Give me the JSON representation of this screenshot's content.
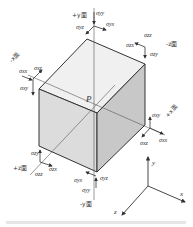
{
  "diagram": {
    "center_label": "P",
    "faces": {
      "plus_y": "+y面",
      "minus_y": "-y面",
      "plus_x": "+x面",
      "minus_x": "-x面",
      "plus_z": "+z面",
      "minus_z": "-z面"
    },
    "stresses": {
      "plus_y": [
        "σyy",
        "σyz",
        "σyx"
      ],
      "minus_y": [
        "σyx",
        "σyy",
        "σyz"
      ],
      "plus_x": [
        "σxy",
        "σxz",
        "σxx"
      ],
      "minus_x": [
        "σxx",
        "σxz",
        "σxy"
      ],
      "plus_z": [
        "σzy",
        "σzz",
        "σzx"
      ],
      "minus_z": [
        "σzz",
        "σzx",
        "σzy"
      ]
    },
    "axes": {
      "x": "x",
      "y": "y",
      "z": "z"
    }
  }
}
